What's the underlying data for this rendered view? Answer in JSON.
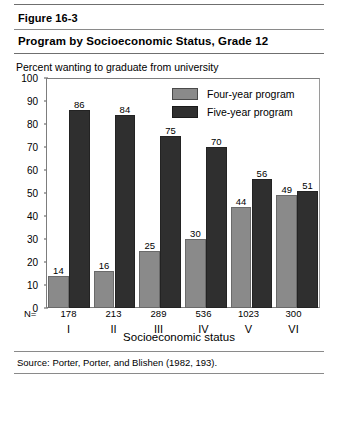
{
  "figure": {
    "number": "Figure 16-3",
    "title": "Program by Socioeconomic Status, Grade 12",
    "source": "Source: Porter, Porter, and Blishen (1982, 193)."
  },
  "legend": {
    "four_year": "Four-year program",
    "five_year": "Five-year program"
  },
  "axis": {
    "y_title": "Percent wanting to graduate from university",
    "x_title": "Socioeconomic status",
    "n_prefix": "N="
  },
  "colors": {
    "four_year": "#8a8a8a",
    "five_year": "#2f2f2f",
    "frame": "#7d7d7d"
  },
  "chart_data": {
    "type": "bar",
    "title": "Program by Socioeconomic Status, Grade 12",
    "subtitle": "Figure 16-3",
    "xlabel": "Socioeconomic status",
    "ylabel": "Percent wanting to graduate from university",
    "ylim": [
      0,
      100
    ],
    "yticks": [
      0,
      10,
      20,
      30,
      40,
      50,
      60,
      70,
      80,
      90,
      100
    ],
    "grid": false,
    "legend_position": "top-right",
    "categories": [
      "I",
      "II",
      "III",
      "IV",
      "V",
      "VI"
    ],
    "n_values": [
      178,
      213,
      289,
      536,
      1023,
      300
    ],
    "series": [
      {
        "name": "Four-year program",
        "values": [
          14,
          16,
          25,
          30,
          44,
          49
        ]
      },
      {
        "name": "Five-year program",
        "values": [
          86,
          84,
          75,
          70,
          56,
          51
        ]
      }
    ]
  }
}
